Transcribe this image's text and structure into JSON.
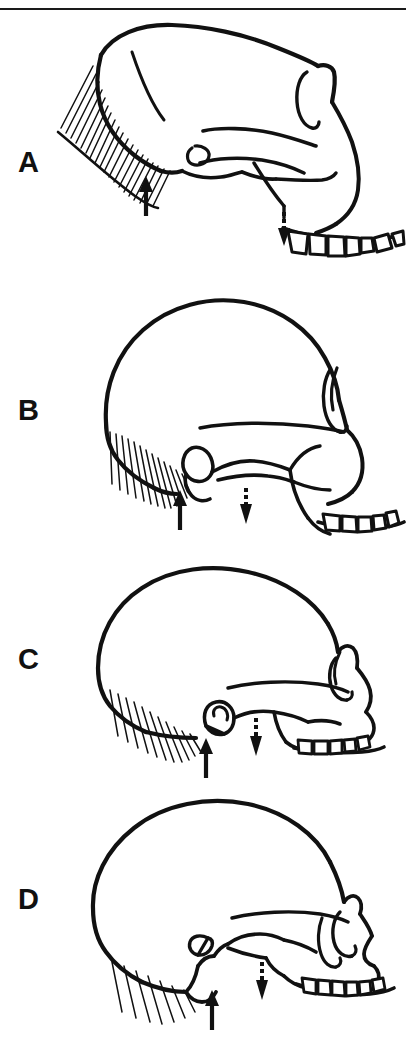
{
  "figure": {
    "type": "scientific-illustration",
    "orientation": "left-facing-right",
    "background_color": "#ffffff",
    "ink_color": "#111111",
    "top_rule": {
      "visible": true,
      "color": "#1a1a1a",
      "thickness_px": 2
    },
    "panel_count": 4
  },
  "panels": [
    {
      "label": "A",
      "label_x": 18,
      "label_y": 152,
      "description": "ape-like skull with sagittal crest region, heavy nuchal hatching, large projecting canine, prognathic muzzle",
      "markers": {
        "solid_arrow": {
          "name": "nuchal-marker",
          "direction": "up",
          "style": "solid"
        },
        "dashed_arrow": {
          "name": "zygomatic-marker",
          "direction": "down",
          "style": "dashed"
        }
      },
      "features": [
        "long low braincase",
        "dense diagonal nuchal hatching",
        "projecting muzzle",
        "large canine",
        "continuous tooth row"
      ]
    },
    {
      "label": "B",
      "label_x": 18,
      "label_y": 400,
      "description": "australopith-like skull with globular braincase, comb-like nuchal striations, oval mastoid, reduced canine",
      "markers": {
        "solid_arrow": {
          "name": "nuchal-marker",
          "direction": "up",
          "style": "solid"
        },
        "dashed_arrow": {
          "name": "zygomatic-marker",
          "direction": "down",
          "style": "dashed"
        }
      },
      "features": [
        "rounded braincase",
        "comb-like nuchal lines",
        "oval mastoid process",
        "moderate prognathism",
        "even tooth row"
      ]
    },
    {
      "label": "C",
      "label_x": 18,
      "label_y": 650,
      "description": "archaic human skull with expanded braincase, looped mastoid process, reduced face",
      "markers": {
        "solid_arrow": {
          "name": "nuchal-marker",
          "direction": "up",
          "style": "solid"
        },
        "dashed_arrow": {
          "name": "zygomatic-marker",
          "direction": "down",
          "style": "dashed"
        }
      },
      "features": [
        "expanded braincase",
        "looped mastoid",
        "reduced nuchal hatching",
        "shorter face",
        "small tooth row"
      ]
    },
    {
      "label": "D",
      "label_x": 18,
      "label_y": 888,
      "description": "modern human skull with high vaulted cranium, prominent mastoid process, orthognathic face, distinct nasal aperture",
      "markers": {
        "solid_arrow": {
          "name": "nuchal-marker",
          "direction": "up",
          "style": "solid"
        },
        "dashed_arrow": {
          "name": "zygomatic-marker",
          "direction": "down",
          "style": "dashed"
        }
      },
      "features": [
        "high vaulted cranium",
        "prominent mastoid process",
        "orthognathic face",
        "nasal aperture",
        "small even teeth"
      ]
    }
  ]
}
